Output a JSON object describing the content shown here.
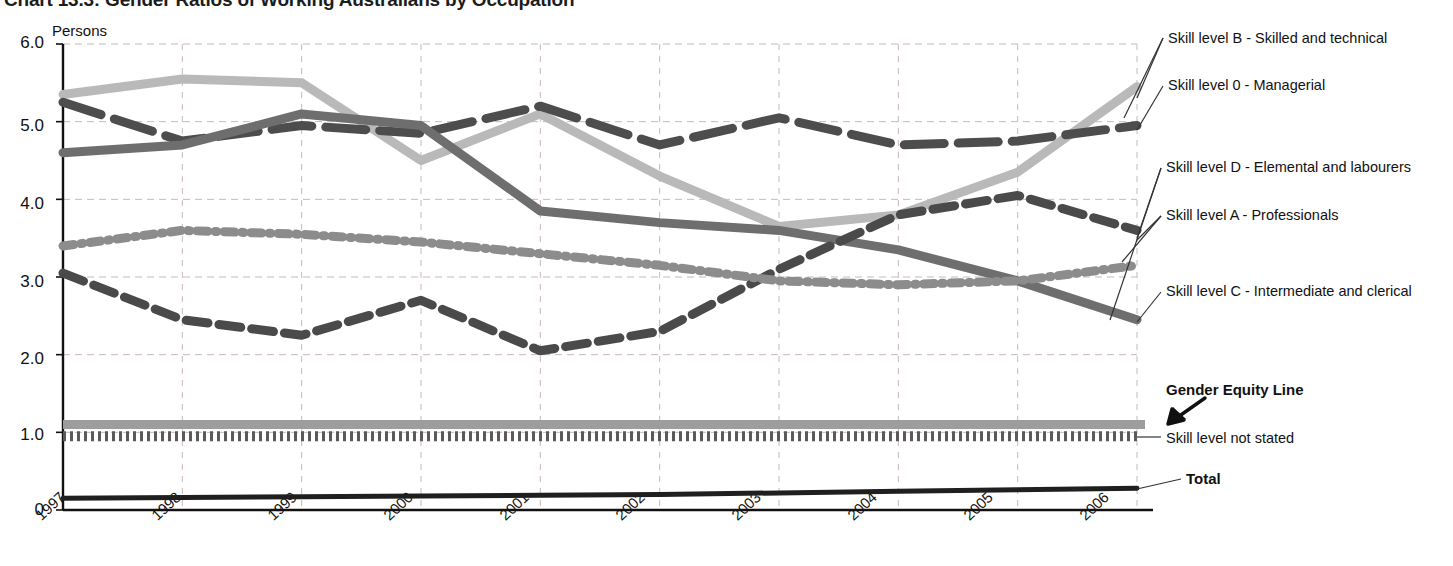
{
  "header": {
    "title": "Chart 13.3: Gender Ratios of Working Australians by Occupation"
  },
  "chart_data": {
    "type": "line",
    "title": "Chart 13.3: Gender Ratios of Working Australians by Occupation",
    "ylabel": "Persons",
    "xlabel": "",
    "ylim": [
      0,
      6.0
    ],
    "grid": true,
    "legend_position": "right-callouts",
    "y_ticks": [
      "6.0",
      "5.0",
      "4.0",
      "3.0",
      "2.0",
      "1.0",
      "0"
    ],
    "y_tick_values": [
      6.0,
      5.0,
      4.0,
      3.0,
      2.0,
      1.0,
      0
    ],
    "categories": [
      "1997",
      "1998",
      "1999",
      "2000",
      "2001",
      "2002",
      "2003",
      "2004",
      "2005",
      "2006"
    ],
    "series": [
      {
        "name": "Skill level B - Skilled and technical",
        "style": "solid-thick",
        "color": "#b9b9b9",
        "values": [
          5.35,
          5.55,
          5.5,
          4.5,
          5.1,
          4.3,
          3.65,
          3.8,
          4.35,
          5.45
        ]
      },
      {
        "name": "Skill level 0 - Managerial",
        "style": "long-dash",
        "color": "#4d4d4d",
        "values": [
          5.25,
          4.75,
          4.95,
          4.85,
          5.2,
          4.7,
          5.05,
          4.7,
          4.75,
          4.95
        ]
      },
      {
        "name": "Skill level D - Elemental and labourers",
        "style": "solid-thick",
        "color": "#6e6e6e",
        "values": [
          4.6,
          4.7,
          5.1,
          4.95,
          3.85,
          3.7,
          3.6,
          3.35,
          2.95,
          2.45
        ]
      },
      {
        "name": "Skill level A - Professionals",
        "style": "dash",
        "color": "#4a4a4a",
        "values": [
          3.05,
          2.45,
          2.25,
          2.7,
          2.05,
          2.3,
          3.1,
          3.8,
          4.05,
          3.6
        ]
      },
      {
        "name": "Skill level C - Intermediate and clerical",
        "style": "dash-dot",
        "color": "#8c8c8c",
        "values": [
          3.4,
          3.6,
          3.55,
          3.45,
          3.3,
          3.15,
          2.95,
          2.9,
          2.95,
          3.15
        ]
      },
      {
        "name": "Skill level not stated",
        "style": "dense-dash",
        "color": "#5a5a5a",
        "values": [
          0.95,
          0.95,
          0.95,
          0.95,
          0.95,
          0.95,
          0.95,
          0.95,
          0.95,
          0.95
        ]
      },
      {
        "name": "Total",
        "style": "solid-thin",
        "color": "#1f1f1f",
        "values": [
          0.15,
          0.16,
          0.17,
          0.18,
          0.19,
          0.2,
          0.22,
          0.24,
          0.26,
          0.28
        ]
      }
    ],
    "annotations": [
      {
        "name": "Gender Equity Line",
        "value": 1.1,
        "style": "solid-thick",
        "color": "#9d9d9d",
        "bold": true
      }
    ]
  },
  "callouts": [
    {
      "label": "Skill level B - Skilled and technical"
    },
    {
      "label": "Skill level 0 - Managerial"
    },
    {
      "label": "Skill level D - Elemental and labourers"
    },
    {
      "label": "Skill level A - Professionals"
    },
    {
      "label": "Skill level C - Intermediate and clerical"
    },
    {
      "label": "Gender Equity Line"
    },
    {
      "label": "Skill level not stated"
    },
    {
      "label": "Total"
    }
  ]
}
